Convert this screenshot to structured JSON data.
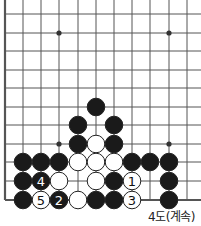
{
  "diagram": {
    "caption": "4도(계속)",
    "grid": {
      "cols_x": [
        5,
        23,
        41,
        59,
        78,
        96,
        114,
        132,
        150,
        169,
        187
      ],
      "rows_y": [
        14,
        33,
        51,
        70,
        88,
        107,
        125,
        144,
        162,
        181,
        200
      ],
      "extend_right_to": 201,
      "extend_top_to": 0,
      "left_border": true,
      "bottom_border": true
    },
    "star_points": [
      {
        "col": 3,
        "row": 1
      },
      {
        "col": 9,
        "row": 1
      },
      {
        "col": 3,
        "row": 7
      },
      {
        "col": 9,
        "row": 7
      }
    ],
    "stones": [
      {
        "col": 5,
        "row": 5,
        "color": "black",
        "label": ""
      },
      {
        "col": 4,
        "row": 6,
        "color": "black",
        "label": ""
      },
      {
        "col": 6,
        "row": 6,
        "color": "black",
        "label": ""
      },
      {
        "col": 4,
        "row": 7,
        "color": "black",
        "label": ""
      },
      {
        "col": 5,
        "row": 7,
        "color": "white",
        "label": ""
      },
      {
        "col": 6,
        "row": 7,
        "color": "black",
        "label": ""
      },
      {
        "col": 1,
        "row": 8,
        "color": "black",
        "label": ""
      },
      {
        "col": 2,
        "row": 8,
        "color": "black",
        "label": ""
      },
      {
        "col": 3,
        "row": 8,
        "color": "black",
        "label": ""
      },
      {
        "col": 4,
        "row": 8,
        "color": "white",
        "label": ""
      },
      {
        "col": 5,
        "row": 8,
        "color": "white",
        "label": ""
      },
      {
        "col": 6,
        "row": 8,
        "color": "white",
        "label": ""
      },
      {
        "col": 7,
        "row": 8,
        "color": "black",
        "label": ""
      },
      {
        "col": 8,
        "row": 8,
        "color": "black",
        "label": ""
      },
      {
        "col": 9,
        "row": 8,
        "color": "black",
        "label": ""
      },
      {
        "col": 1,
        "row": 9,
        "color": "black",
        "label": ""
      },
      {
        "col": 2,
        "row": 9,
        "color": "black",
        "label": "4"
      },
      {
        "col": 3,
        "row": 9,
        "color": "white",
        "label": ""
      },
      {
        "col": 5,
        "row": 9,
        "color": "white",
        "label": ""
      },
      {
        "col": 6,
        "row": 9,
        "color": "black",
        "label": ""
      },
      {
        "col": 7,
        "row": 9,
        "color": "white",
        "label": "1"
      },
      {
        "col": 9,
        "row": 9,
        "color": "black",
        "label": ""
      },
      {
        "col": 1,
        "row": 10,
        "color": "black",
        "label": ""
      },
      {
        "col": 2,
        "row": 10,
        "color": "white",
        "label": "5"
      },
      {
        "col": 3,
        "row": 10,
        "color": "black",
        "label": "2"
      },
      {
        "col": 4,
        "row": 10,
        "color": "white",
        "label": ""
      },
      {
        "col": 5,
        "row": 10,
        "color": "black",
        "label": ""
      },
      {
        "col": 6,
        "row": 10,
        "color": "black",
        "label": ""
      },
      {
        "col": 7,
        "row": 10,
        "color": "white",
        "label": "3"
      },
      {
        "col": 9,
        "row": 10,
        "color": "black",
        "label": ""
      }
    ],
    "colors": {
      "line": "#555555",
      "black": "#1a1a1a",
      "white": "#ffffff",
      "stroke": "#222222"
    }
  }
}
